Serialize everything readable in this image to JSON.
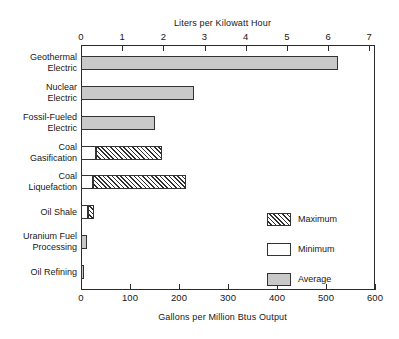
{
  "chart_data": {
    "type": "bar",
    "orientation": "horizontal",
    "title": "",
    "top_axis_label": "Liters per Kilowatt Hour",
    "bottom_axis_label": "Gallons per Million Btus Output",
    "ylabel": "",
    "top_ticks": [
      "0",
      "1",
      "2",
      "3",
      "4",
      "5",
      "6",
      "7"
    ],
    "top_tick_values": [
      0,
      1,
      2,
      3,
      4,
      5,
      6,
      7
    ],
    "top_axis_range": [
      0,
      7.14
    ],
    "bottom_ticks": [
      "0",
      "100",
      "200",
      "300",
      "400",
      "500",
      "600"
    ],
    "bottom_tick_values": [
      0,
      100,
      200,
      300,
      400,
      500,
      600
    ],
    "bottom_axis_range": [
      0,
      600
    ],
    "grid": false,
    "legend_position": "inside-lower-right",
    "categories": [
      "Geothermal\nElectric",
      "Nuclear\nElectric",
      "Fossil-Fueled\nElectric",
      "Coal\nGasification",
      "Coal\nLiquefaction",
      "Oil Shale",
      "Uranium Fuel\nProcessing",
      "Oil Refining"
    ],
    "series": [
      {
        "name": "Minimum",
        "pattern": "dots",
        "values": [
          null,
          null,
          null,
          30,
          25,
          14,
          null,
          null
        ]
      },
      {
        "name": "Maximum",
        "pattern": "diagonal-hatch",
        "values": [
          null,
          null,
          null,
          165,
          215,
          26,
          null,
          null
        ]
      },
      {
        "name": "Average",
        "pattern": "solid-gray",
        "values": [
          525,
          230,
          152,
          null,
          null,
          null,
          13,
          7
        ]
      }
    ],
    "bars": [
      {
        "category": "Geothermal Electric",
        "average": 525,
        "minimum": null,
        "maximum": null
      },
      {
        "category": "Nuclear Electric",
        "average": 230,
        "minimum": null,
        "maximum": null
      },
      {
        "category": "Fossil-Fueled Electric",
        "average": 152,
        "minimum": null,
        "maximum": null
      },
      {
        "category": "Coal Gasification",
        "average": null,
        "minimum": 30,
        "maximum": 165
      },
      {
        "category": "Coal Liquefaction",
        "average": null,
        "minimum": 25,
        "maximum": 215
      },
      {
        "category": "Oil Shale",
        "average": null,
        "minimum": 14,
        "maximum": 26
      },
      {
        "category": "Uranium Fuel Processing",
        "average": 13,
        "minimum": null,
        "maximum": null
      },
      {
        "category": "Oil Refining",
        "average": 7,
        "minimum": null,
        "maximum": null
      }
    ]
  },
  "legend": {
    "items": [
      {
        "label": "Maximum",
        "pattern": "diagonal-hatch"
      },
      {
        "label": "Minimum",
        "pattern": "dots"
      },
      {
        "label": "Average",
        "pattern": "solid-gray"
      }
    ]
  },
  "colors": {
    "average_fill": "#c9c9c9",
    "outline": "#333333",
    "axis": "#2b2b2b",
    "text": "#171717",
    "background": "#ffffff"
  }
}
